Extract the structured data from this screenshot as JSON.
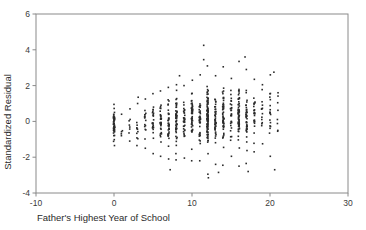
{
  "chart_data": {
    "type": "scatter",
    "title": "",
    "xlabel": "Father's Highest Year of School",
    "ylabel": "Standardized Residual",
    "xlim": [
      -10,
      30
    ],
    "ylim": [
      -4,
      6
    ],
    "xticks": [
      -10,
      0,
      10,
      20,
      30
    ],
    "yticks": [
      -4,
      -2,
      0,
      2,
      4,
      6
    ],
    "xtick_labels": [
      "-10",
      "0",
      "10",
      "20",
      "30"
    ],
    "ytick_labels": [
      "-4",
      "-2",
      "0",
      "2",
      "4",
      "6"
    ],
    "grid": false,
    "legend": null,
    "marker": "square",
    "marker_size_px": 1.6,
    "marker_color": "#2b2b2b",
    "frame_color": "#8a8a8a",
    "columns": [
      {
        "x": 0,
        "n": 46,
        "center": -0.15,
        "spread": 0.62,
        "min": -1.35,
        "max": 0.95
      },
      {
        "x": 1,
        "n": 3,
        "center": -0.2,
        "spread": 0.55,
        "min": -0.8,
        "max": 0.4
      },
      {
        "x": 2,
        "n": 6,
        "center": -0.25,
        "spread": 0.7,
        "min": -1.1,
        "max": 0.7
      },
      {
        "x": 3,
        "n": 9,
        "center": -0.2,
        "spread": 0.8,
        "min": -1.35,
        "max": 1.0
      },
      {
        "x": 4,
        "n": 14,
        "center": -0.1,
        "spread": 0.85,
        "min": -1.5,
        "max": 1.25
      },
      {
        "x": 5,
        "n": 22,
        "center": -0.05,
        "spread": 0.95,
        "min": -1.8,
        "max": 1.55
      },
      {
        "x": 6,
        "n": 30,
        "center": -0.05,
        "spread": 1.0,
        "min": -1.95,
        "max": 1.7
      },
      {
        "x": 7,
        "n": 36,
        "center": 0.0,
        "spread": 1.05,
        "min": -2.1,
        "max": 1.9
      },
      {
        "x": 8,
        "n": 52,
        "center": 0.05,
        "spread": 1.05,
        "min": -2.15,
        "max": 2.05
      },
      {
        "x": 9,
        "n": 30,
        "center": 0.05,
        "spread": 1.05,
        "min": -2.05,
        "max": 2.0
      },
      {
        "x": 10,
        "n": 46,
        "center": 0.1,
        "spread": 1.1,
        "min": -2.2,
        "max": 2.3
      },
      {
        "x": 11,
        "n": 34,
        "center": 0.15,
        "spread": 1.1,
        "min": -2.2,
        "max": 2.6
      },
      {
        "x": 12,
        "n": 96,
        "center": 0.15,
        "spread": 1.2,
        "min": -2.95,
        "max": 3.1
      },
      {
        "x": 13,
        "n": 42,
        "center": 0.2,
        "spread": 1.15,
        "min": -2.4,
        "max": 2.55
      },
      {
        "x": 14,
        "n": 50,
        "center": 0.25,
        "spread": 1.15,
        "min": -2.45,
        "max": 3.05
      },
      {
        "x": 15,
        "n": 26,
        "center": 0.3,
        "spread": 1.1,
        "min": -1.95,
        "max": 2.4
      },
      {
        "x": 16,
        "n": 62,
        "center": 0.35,
        "spread": 1.2,
        "min": -2.5,
        "max": 3.35
      },
      {
        "x": 17,
        "n": 38,
        "center": 0.35,
        "spread": 1.15,
        "min": -2.35,
        "max": 2.9
      },
      {
        "x": 18,
        "n": 22,
        "center": 0.4,
        "spread": 1.0,
        "min": -1.7,
        "max": 2.35
      },
      {
        "x": 19,
        "n": 12,
        "center": 0.45,
        "spread": 0.95,
        "min": -1.25,
        "max": 2.05
      },
      {
        "x": 20,
        "n": 16,
        "center": 0.5,
        "spread": 1.05,
        "min": -1.95,
        "max": 2.6
      },
      {
        "x": 21,
        "n": 6,
        "center": 0.55,
        "spread": 0.85,
        "min": -0.55,
        "max": 1.6
      }
    ],
    "outliers": [
      {
        "x": 11.5,
        "y": 4.25
      },
      {
        "x": 11.5,
        "y": 3.45
      },
      {
        "x": 8.4,
        "y": 2.55
      },
      {
        "x": 16.8,
        "y": 3.6
      },
      {
        "x": 20.5,
        "y": 2.75
      },
      {
        "x": 3.1,
        "y": 1.35
      },
      {
        "x": 12.1,
        "y": -3.15
      },
      {
        "x": 7.2,
        "y": -2.7
      },
      {
        "x": 13.4,
        "y": -2.85
      },
      {
        "x": 17.2,
        "y": -2.8
      },
      {
        "x": 20.6,
        "y": -2.7
      }
    ]
  }
}
